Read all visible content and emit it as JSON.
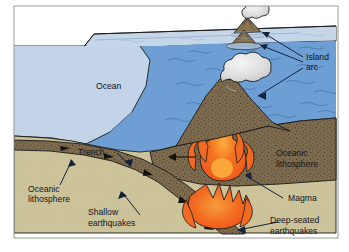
{
  "figure": {
    "type": "geological-cross-section",
    "canvas": {
      "width": 349,
      "height": 252
    },
    "background": "#ffffff"
  },
  "labels": {
    "ocean": "Ocean",
    "island_arc_line1": "Island",
    "island_arc_line2": "arc",
    "trench": "Trench",
    "oceanic_lithosphere_left_line1": "Oceanic",
    "oceanic_lithosphere_left_line2": "lithosphere",
    "oceanic_lithosphere_right_line1": "Oceanic",
    "oceanic_lithosphere_right_line2": "lithosphere",
    "shallow_earthquakes_line1": "Shallow",
    "shallow_earthquakes_line2": "earthquakes",
    "deep_earthquakes_line1": "Deep-seated",
    "deep_earthquakes_line2": "earthquakes",
    "magma": "Magma"
  },
  "colors": {
    "ocean_surface": "#c3d4e8",
    "water_face": "#6e9ed4",
    "water_face_dark": "#5b8ec8",
    "mantle": "#cdc39a",
    "lithosphere": "#7d6b4f",
    "magma_outer": "#f26f21",
    "magma_inner": "#f04b23",
    "magma_core": "#f9a03f",
    "plume": "#e3e3e3",
    "outline": "#1a1a1a",
    "label_text": "#10131c",
    "volcano_cone": "#8a7350"
  },
  "features": [
    {
      "name": "ocean-surface-plane",
      "kind": "surface"
    },
    {
      "name": "water-body",
      "kind": "water"
    },
    {
      "name": "overriding-plate",
      "kind": "lithosphere"
    },
    {
      "name": "subducting-slab",
      "kind": "lithosphere"
    },
    {
      "name": "mantle-wedge",
      "kind": "mantle"
    },
    {
      "name": "magma-plume",
      "kind": "magma"
    },
    {
      "name": "deep-magma-body",
      "kind": "magma"
    },
    {
      "name": "island-arc-volcano",
      "kind": "volcano"
    },
    {
      "name": "submarine-volcano",
      "kind": "volcano"
    },
    {
      "name": "eruption-plume",
      "kind": "plume"
    }
  ]
}
